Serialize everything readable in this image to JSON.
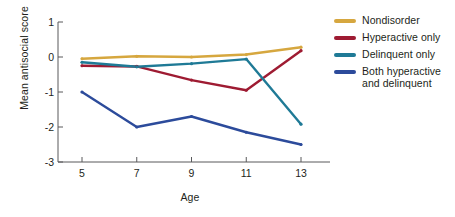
{
  "chart_data": {
    "type": "line",
    "title": "",
    "xlabel": "Age",
    "ylabel": "Mean antisocial score",
    "categories": [
      "5",
      "7",
      "9",
      "11",
      "13"
    ],
    "x": [
      5,
      7,
      9,
      11,
      13
    ],
    "xlim": [
      4,
      14
    ],
    "ylim": [
      -3,
      1
    ],
    "xticks": [
      "5",
      "7",
      "9",
      "11",
      "13"
    ],
    "yticks": [
      "1",
      "0",
      "-1",
      "-2",
      "-3"
    ],
    "grid": false,
    "legend_position": "right",
    "markers": "small-dot",
    "series": [
      {
        "name": "Nondisorder",
        "color": "#d6a73f",
        "values": [
          -0.05,
          0.02,
          0.0,
          0.07,
          0.28
        ]
      },
      {
        "name": "Hyperactive only",
        "color": "#9e1b32",
        "values": [
          -0.25,
          -0.27,
          -0.66,
          -0.95,
          0.18
        ]
      },
      {
        "name": "Delinquent only",
        "color": "#1f7a96",
        "values": [
          -0.15,
          -0.28,
          -0.19,
          -0.06,
          -1.92
        ]
      },
      {
        "name": "Both hyperactive\nand delinquent",
        "color": "#2c4b9b",
        "values": [
          -1.0,
          -2.0,
          -1.7,
          -2.15,
          -2.5
        ]
      }
    ]
  },
  "axis": {
    "line_color": "#58595b",
    "x_title": "Age",
    "y_title": "Mean antisocial score"
  },
  "legend": {
    "items": [
      {
        "label": "Nondisorder",
        "color": "#d6a73f"
      },
      {
        "label": "Hyperactive only",
        "color": "#9e1b32"
      },
      {
        "label": "Delinquent only",
        "color": "#1f7a96"
      },
      {
        "label": "Both hyperactive\nand delinquent",
        "color": "#2c4b9b"
      }
    ]
  }
}
